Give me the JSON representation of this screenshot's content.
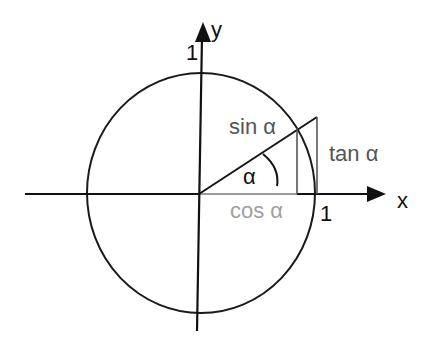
{
  "diagram": {
    "labels": {
      "y_axis": "y",
      "x_axis": "x",
      "y_unit": "1",
      "x_unit": "1",
      "sin": "sin α",
      "cos": "cos α",
      "tan": "tan α",
      "angle": "α"
    },
    "colors": {
      "axis": "#111111",
      "circle": "#1a1a1a",
      "hypotenuse": "#151515",
      "sin_line": "#555555",
      "tan_line": "#555555",
      "cos_segment": "#9a9a9a",
      "sin_text": "#555555",
      "tan_text": "#555555",
      "cos_text": "#a0a0a0",
      "axis_text": "#111111"
    },
    "geometry": {
      "origin": [
        199,
        194
      ],
      "radius_x": 116,
      "radius_y": 120,
      "angle_deg": 33,
      "point_on_circle": [
        297,
        128
      ],
      "tan_top": [
        317,
        117
      ]
    }
  }
}
